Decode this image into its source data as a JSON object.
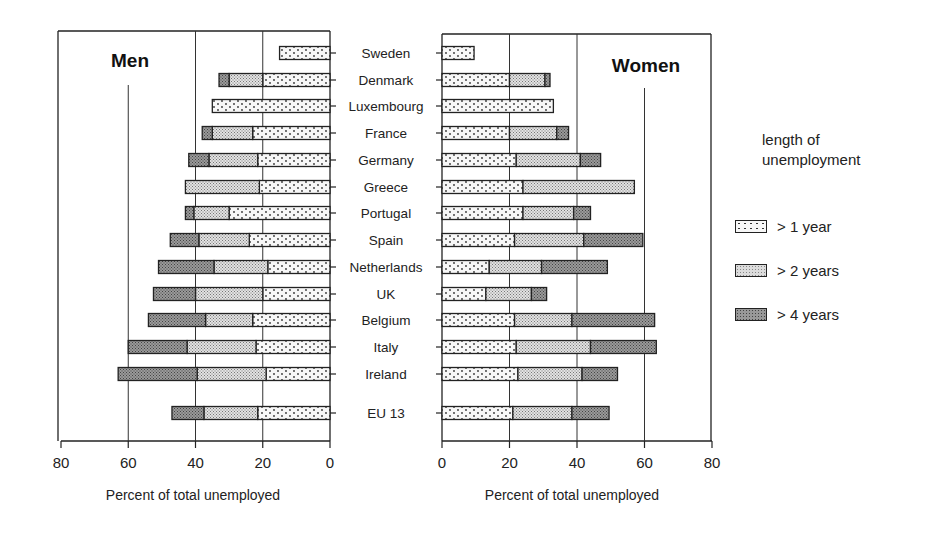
{
  "chart_data": {
    "type": "bar",
    "orientation": "horizontal",
    "layout": "back-to-back (population pyramid style), stacked/cumulative",
    "title": "",
    "categories": [
      "Sweden",
      "Denmark",
      "Luxembourg",
      "France",
      "Germany",
      "Greece",
      "Portugal",
      "Spain",
      "Netherlands",
      "UK",
      "Belgium",
      "Italy",
      "Ireland",
      "EU 13"
    ],
    "panels": [
      {
        "name": "Men",
        "xlabel": "Percent of total unemployed",
        "xlim": [
          80,
          0
        ],
        "xticks": [
          80,
          60,
          40,
          20,
          0
        ],
        "reference_line": 60,
        "gridlines": [
          40,
          20
        ],
        "series": [
          {
            "name": "> 1 year",
            "values": [
              15,
              33,
              35,
              38,
              42,
              43,
              43,
              47.5,
              51,
              52.5,
              54,
              60,
              63,
              47
            ]
          },
          {
            "name": "> 2 years",
            "values": [
              null,
              30,
              null,
              35,
              36,
              43,
              40.5,
              39,
              34.5,
              40,
              37,
              42.5,
              39.5,
              37.5
            ]
          },
          {
            "name": "> 4 years",
            "values": [
              null,
              20,
              null,
              23,
              21.5,
              21,
              30,
              24,
              18.5,
              20,
              23,
              22,
              19,
              21.5
            ]
          }
        ],
        "segments_note": "values are cumulative boundaries read from the bars: total length (>1 year), boundary of >2 years, boundary of innermost segment"
      },
      {
        "name": "Women",
        "xlabel": "Percent of total unemployed",
        "xlim": [
          0,
          80
        ],
        "xticks": [
          0,
          20,
          40,
          60,
          80
        ],
        "reference_line": 60,
        "gridlines": [
          20,
          40
        ],
        "series": [
          {
            "name": "> 1 year",
            "values": [
              9.5,
              32,
              33,
              37.5,
              47,
              57,
              44,
              59.5,
              49,
              31,
              63,
              63.5,
              52,
              49.5
            ]
          },
          {
            "name": "> 2 years",
            "values": [
              null,
              30.5,
              null,
              34,
              41,
              57,
              39,
              42,
              29.5,
              26.5,
              38.5,
              44,
              41.5,
              38.5
            ]
          },
          {
            "name": "> 4 years",
            "values": [
              null,
              20,
              null,
              20,
              22,
              24,
              24,
              21.5,
              14,
              13,
              21.5,
              22,
              22.5,
              21
            ]
          }
        ]
      }
    ],
    "legend": {
      "title": "length of unemployment",
      "entries": [
        "> 1 year",
        "> 2 years",
        "> 4 years"
      ],
      "position": "right"
    }
  },
  "labels": {
    "men": "Men",
    "women": "Women",
    "xlabel_left": "Percent of total unemployed",
    "xlabel_right": "Percent of total unemployed",
    "legend_title_1": "length of",
    "legend_title_2": "unemployment",
    "legend_1": "> 1 year",
    "legend_2": "> 2 years",
    "legend_3": "> 4 years"
  },
  "colors": {
    "ink": "#1a1a1a",
    "fill_light": "#f4f4f4",
    "fill_mid": "#d6d6d6",
    "fill_dark": "#8c8c8c"
  }
}
